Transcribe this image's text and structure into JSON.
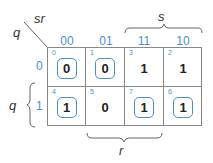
{
  "kmap": {
    "corner": {
      "col_vars": "sr",
      "row_vars": "q"
    },
    "columns": [
      "00",
      "01",
      "11",
      "10"
    ],
    "rows": [
      "0",
      "1"
    ],
    "cells": [
      [
        {
          "index": "0",
          "value": "0",
          "grouped": true
        },
        {
          "index": "1",
          "value": "0",
          "grouped": true
        },
        {
          "index": "3",
          "value": "1",
          "grouped": false
        },
        {
          "index": "2",
          "value": "1",
          "grouped": false
        }
      ],
      [
        {
          "index": "4",
          "value": "1",
          "grouped": true
        },
        {
          "index": "5",
          "value": "0",
          "grouped": false
        },
        {
          "index": "7",
          "value": "1",
          "grouped": true
        },
        {
          "index": "6",
          "value": "1",
          "grouped": true
        }
      ]
    ],
    "braces": {
      "top": "s",
      "left": "q",
      "bottom": "r"
    },
    "colors": {
      "accent": "#4a8fd0",
      "grid": "#888888",
      "text": "#222222"
    }
  }
}
